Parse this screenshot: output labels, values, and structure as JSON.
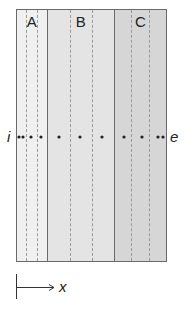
{
  "regions": [
    {
      "label": "A",
      "width": 30,
      "fill": "#f0f0f0",
      "dashes": [
        9,
        20
      ]
    },
    {
      "label": "B",
      "width": 68,
      "fill": "#e4e4e4",
      "dashes": [
        22,
        44
      ]
    },
    {
      "label": "C",
      "width": 53,
      "fill": "#d6d6d6",
      "dashes": [
        16,
        34
      ]
    }
  ],
  "path": {
    "start_label": "i",
    "end_label": "e",
    "y": 137,
    "dots_x": [
      19,
      23,
      31,
      41,
      59,
      80,
      102,
      124,
      142,
      158,
      163
    ]
  },
  "axis": {
    "label": "x"
  },
  "colors": {
    "border": "#6a6a6a",
    "dash": "#9a9a9a",
    "dot": "#222222"
  }
}
